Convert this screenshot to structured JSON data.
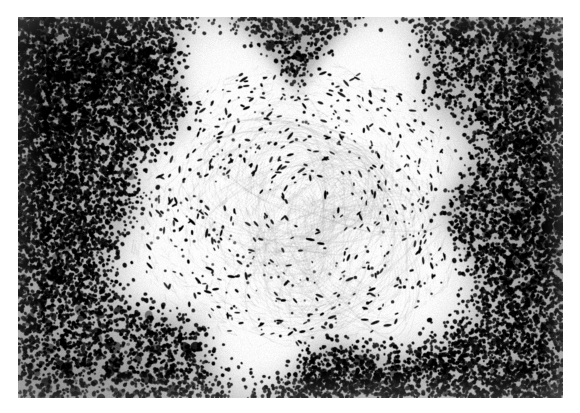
{
  "document": {
    "kind": "photomicrograph-plate",
    "title": "Histopathology micrograph",
    "caption": "",
    "labels": [],
    "has_text": false,
    "has_scale_bar": false,
    "stain": "hematoxylin and eosin",
    "rendering": "grayscale halftone print"
  },
  "page": {
    "width": 580,
    "height": 413,
    "background_color": "#ffffff",
    "margin_left": 18,
    "margin_top": 17,
    "margin_right": 17,
    "margin_bottom": 15
  },
  "plate": {
    "x": 18,
    "y": 17,
    "width": 545,
    "height": 381,
    "base_color": "#f4f3f1",
    "border": "none"
  },
  "image_content": {
    "subject": "granuloma surrounded by dense lymphocytic mantle",
    "regions": [
      {
        "name": "central-granuloma",
        "description": "pale oval zone of epithelioid histiocytes and whorled fibrous stroma with sparse elongated dark nuclei",
        "center_x": 300,
        "center_y": 205,
        "radius_x": 175,
        "radius_y": 140,
        "tone": "pale",
        "mean_gray": "#efeeec",
        "nuclei_density": "sparse",
        "nuclei_shape": "elongated-spindled"
      },
      {
        "name": "lymphocyte-mantle",
        "description": "dense dark rim of small round lymphocyte nuclei filling the periphery of the field",
        "tone": "dark",
        "mean_gray": "#4a4a4a",
        "nuclei_density": "very-dense",
        "nuclei_shape": "small-round"
      },
      {
        "name": "transition-zone",
        "description": "gradual interface where lymphocyte density falls off into the pale granuloma",
        "tone": "intermediate",
        "mean_gray": "#9a9a98"
      }
    ],
    "palette": {
      "paper_white": "#ffffff",
      "background_light": "#f4f3f1",
      "mid_gray": "#8e8e8c",
      "nucleus_dark": "#141414",
      "deep_black": "#000000"
    }
  },
  "render_params": {
    "seed": 20240517,
    "mantle_nuclei_count": 14000,
    "granuloma_nuclei_count": 620,
    "whorl_count": 9,
    "grain_strength": 0.085
  }
}
